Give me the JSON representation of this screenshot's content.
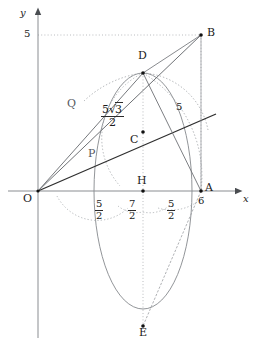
{
  "figure": {
    "background_color": "#ffffff",
    "axes": {
      "x_axis_label": "x",
      "y_axis_label": "y",
      "axis_color": "#8a8d91",
      "origin_label": "O",
      "y_tick_labels": [
        "5"
      ],
      "x_tick_labels": [
        "6"
      ]
    },
    "points": [
      {
        "id": "O",
        "label": "O",
        "x": 0,
        "y": 0
      },
      {
        "id": "A",
        "label": "A",
        "x": 6,
        "y": 0
      },
      {
        "id": "B",
        "label": "B",
        "x": 6,
        "y": 5
      },
      {
        "id": "C",
        "label": "C",
        "x": 3.5,
        "y": 2.1667
      },
      {
        "id": "D",
        "label": "D",
        "x": 3.5,
        "y": 4.3301
      },
      {
        "id": "E",
        "label": "E",
        "x": 3.5,
        "y": -4.3301
      },
      {
        "id": "H",
        "label": "H",
        "x": 3.5,
        "y": 0
      },
      {
        "id": "P",
        "label": "P",
        "x": 1.9,
        "y": 1.18
      },
      {
        "id": "Q",
        "label": "Q",
        "x": 1.25,
        "y": 3.05
      }
    ],
    "segment_labels": [
      {
        "id": "OD-label",
        "text_parts": {
          "numerator_prefix": "5",
          "radical": "3",
          "denominator": "2"
        },
        "plain": "5√3/2"
      },
      {
        "id": "AB-label",
        "text": "5"
      }
    ],
    "baseline_labels": [
      {
        "id": "OH-span",
        "numerator": "5",
        "denominator": "2"
      },
      {
        "id": "HA-span-left",
        "numerator": "7",
        "denominator": "2"
      },
      {
        "id": "HA-span-right",
        "numerator": "5",
        "denominator": "2"
      }
    ],
    "colors": {
      "solid_line": "#3a3a3a",
      "thin_line": "#6e7175",
      "dotted_line": "#9b9ea2",
      "curve": "#7d8084",
      "point_fill": "#111111",
      "text": "#1a1a1a"
    },
    "elements": {
      "ellipse_name": "ellipse-through-D-E",
      "arc_names": [
        "arc-left-dotted",
        "arc-right-dotted",
        "arc-lower-left-dotted",
        "arc-lower-right-dotted"
      ],
      "line_names": [
        "line-OB",
        "line-OD",
        "line-AB",
        "line-AD",
        "line-AE",
        "line-OA-axis"
      ],
      "guide_names": [
        "guide-vertical-DHE",
        "guide-vertical-B-A",
        "guide-horizontal-y5-B"
      ]
    }
  }
}
